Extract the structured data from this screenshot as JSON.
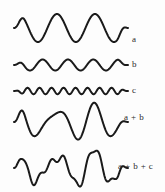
{
  "figure": {
    "background_color": "#fdfdfd",
    "stroke_color": "#1a1a1a",
    "label_color": "#2a2a2a",
    "width": 165,
    "height": 192
  },
  "labels": {
    "a": "a",
    "b": "b",
    "c": "c",
    "a_plus_b": "a + b",
    "a_plus_b_plus_c": "a + b + c"
  },
  "chart_data": {
    "type": "line",
    "xlabel": "",
    "ylabel": "",
    "grid": false,
    "legend": "right",
    "x_range": [
      0,
      1
    ],
    "x_samples": 400,
    "series": [
      {
        "name": "a",
        "label": "a",
        "kind": "sine",
        "amplitude": 14,
        "cycles": 3,
        "phase": 0.12,
        "baseline_y": 28,
        "x_start": 14,
        "x_end": 128,
        "stroke_width": 2.0,
        "taper": true
      },
      {
        "name": "b",
        "label": "b",
        "kind": "sine",
        "amplitude": 5.5,
        "cycles": 4.5,
        "phase": 0.12,
        "baseline_y": 65,
        "x_start": 14,
        "x_end": 128,
        "stroke_width": 2.0,
        "taper": true
      },
      {
        "name": "c",
        "label": "c",
        "kind": "sine",
        "amplitude": 3.2,
        "cycles": 9.5,
        "phase": 0.12,
        "baseline_y": 91,
        "x_start": 14,
        "x_end": 128,
        "stroke_width": 2.0,
        "taper": true
      },
      {
        "name": "a+b",
        "label": "a + b",
        "kind": "sum",
        "components": [
          "a",
          "b"
        ],
        "baseline_y": 122,
        "x_start": 14,
        "x_end": 128,
        "stroke_width": 2.0,
        "taper": true
      },
      {
        "name": "a+b+c",
        "label": "a + b + c",
        "kind": "sum",
        "components": [
          "a",
          "b",
          "c"
        ],
        "baseline_y": 168,
        "x_start": 14,
        "x_end": 128,
        "stroke_width": 2.0,
        "taper": true
      }
    ]
  }
}
